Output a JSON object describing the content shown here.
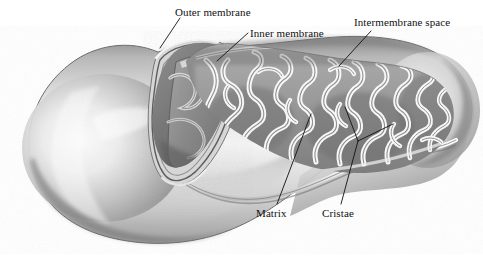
{
  "figure": {
    "background_color": "#ffffff",
    "ink_color": "#111111"
  },
  "labels": {
    "outer_membrane": "Outer membrane",
    "inner_membrane": "Inner membrane",
    "intermembrane_space": "Intermembrane space",
    "matrix": "Matrix",
    "cristae": "Cristae"
  },
  "leaders": {
    "outer_membrane": "M 180 18 L 160 48",
    "inner_membrane": "M 248 33 L 217 61",
    "intermembrane_space": "M 371 31 L 339 66",
    "matrix": "M 277 204 L 311 114",
    "cristae_stem": "M 341 204 L 358 141",
    "cristae_branch_up": "M 358 141 L 345 107",
    "cristae_branch_right": "M 358 141 L 393 124"
  },
  "palette": {
    "body_light": "#f2f2f2",
    "body_mid": "#c9c9c9",
    "body_shadow": "#8e8e8e",
    "body_dark": "#6e6e6e",
    "outline": "#5a5a5a",
    "matrix_fill": "#9a9a9a",
    "matrix_dark": "#6a6a6a",
    "crista_light": "#fbfbfb",
    "crista_edge": "#8a8a8a",
    "cap_interior": "#7d7d7d",
    "rim_highlight": "#ffffff"
  }
}
